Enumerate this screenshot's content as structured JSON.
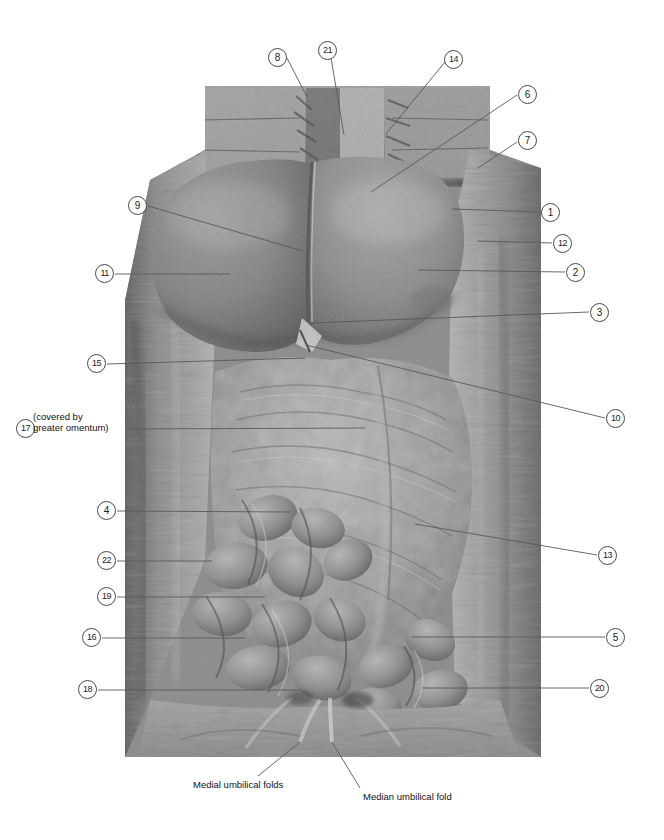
{
  "plate": {
    "title": "Abdominal cavity dissection — anterior view",
    "width": 664,
    "height": 840,
    "background": "#ffffff",
    "line_color": "#595959",
    "bubble_border": "#4a4a4a",
    "text_color": "#111111"
  },
  "photo": {
    "alt": "Grayscale cadaver dissection photograph of the opened anterior abdominal wall showing liver, greater omentum, small intestine and umbilical folds",
    "frame": {
      "left": 125,
      "top": 86,
      "right": 541,
      "bottom": 757
    }
  },
  "callouts": [
    {
      "id": "8",
      "label": "8",
      "side": "top",
      "bubble": {
        "x": 268,
        "y": 48
      },
      "leader": [
        [
          287,
          58
        ],
        [
          307,
          97
        ]
      ]
    },
    {
      "id": "21",
      "label": "21",
      "side": "top",
      "bubble": {
        "x": 318,
        "y": 41
      },
      "leader": [
        [
          330,
          52
        ],
        [
          344,
          135
        ]
      ]
    },
    {
      "id": "14",
      "label": "14",
      "side": "top",
      "bubble": {
        "x": 444,
        "y": 50
      },
      "leader": [
        [
          445,
          62
        ],
        [
          386,
          134
        ]
      ]
    },
    {
      "id": "6",
      "label": "6",
      "side": "right",
      "bubble": {
        "x": 518,
        "y": 85
      },
      "leader": [
        [
          517,
          95
        ],
        [
          371,
          192
        ]
      ]
    },
    {
      "id": "7",
      "label": "7",
      "side": "right",
      "bubble": {
        "x": 518,
        "y": 131
      },
      "leader": [
        [
          517,
          142
        ],
        [
          478,
          168
        ]
      ]
    },
    {
      "id": "1",
      "label": "1",
      "side": "right",
      "bubble": {
        "x": 541,
        "y": 203
      },
      "leader": [
        [
          540,
          212
        ],
        [
          452,
          209
        ]
      ]
    },
    {
      "id": "12",
      "label": "12",
      "side": "right",
      "bubble": {
        "x": 553,
        "y": 234
      },
      "leader": [
        [
          552,
          243
        ],
        [
          478,
          241
        ]
      ]
    },
    {
      "id": "2",
      "label": "2",
      "side": "right",
      "bubble": {
        "x": 566,
        "y": 263
      },
      "leader": [
        [
          565,
          272
        ],
        [
          418,
          270
        ]
      ]
    },
    {
      "id": "3",
      "label": "3",
      "side": "right",
      "bubble": {
        "x": 590,
        "y": 303
      },
      "leader": [
        [
          589,
          312
        ],
        [
          311,
          323
        ]
      ]
    },
    {
      "id": "10",
      "label": "10",
      "side": "right",
      "bubble": {
        "x": 606,
        "y": 409
      },
      "leader": [
        [
          605,
          418
        ],
        [
          306,
          345
        ]
      ]
    },
    {
      "id": "13",
      "label": "13",
      "side": "right",
      "bubble": {
        "x": 598,
        "y": 546
      },
      "leader": [
        [
          597,
          555
        ],
        [
          415,
          524
        ]
      ]
    },
    {
      "id": "5",
      "label": "5",
      "side": "right",
      "bubble": {
        "x": 606,
        "y": 628
      },
      "leader": [
        [
          605,
          637
        ],
        [
          412,
          637
        ]
      ]
    },
    {
      "id": "20",
      "label": "20",
      "side": "right",
      "bubble": {
        "x": 590,
        "y": 679
      },
      "leader": [
        [
          589,
          688
        ],
        [
          422,
          688
        ]
      ]
    },
    {
      "id": "9",
      "label": "9",
      "side": "left",
      "bubble": {
        "x": 128,
        "y": 196
      },
      "leader": [
        [
          148,
          206
        ],
        [
          303,
          251
        ]
      ]
    },
    {
      "id": "11",
      "label": "11",
      "side": "left",
      "bubble": {
        "x": 95,
        "y": 264
      },
      "leader": [
        [
          115,
          274
        ],
        [
          230,
          274
        ]
      ]
    },
    {
      "id": "15",
      "label": "15",
      "side": "left",
      "bubble": {
        "x": 87,
        "y": 354
      },
      "leader": [
        [
          107,
          364
        ],
        [
          305,
          358
        ]
      ]
    },
    {
      "id": "17",
      "label": "17",
      "side": "left",
      "bubble": {
        "x": 16,
        "y": 419
      },
      "leader": [
        [
          130,
          429
        ],
        [
          365,
          428
        ]
      ]
    },
    {
      "id": "4",
      "label": "4",
      "side": "left",
      "bubble": {
        "x": 97,
        "y": 501
      },
      "leader": [
        [
          117,
          511
        ],
        [
          290,
          512
        ]
      ]
    },
    {
      "id": "22",
      "label": "22",
      "side": "left",
      "bubble": {
        "x": 97,
        "y": 551
      },
      "leader": [
        [
          117,
          561
        ],
        [
          212,
          561
        ]
      ]
    },
    {
      "id": "19",
      "label": "19",
      "side": "left",
      "bubble": {
        "x": 97,
        "y": 587
      },
      "leader": [
        [
          117,
          597
        ],
        [
          265,
          597
        ]
      ]
    },
    {
      "id": "16",
      "label": "16",
      "side": "left",
      "bubble": {
        "x": 82,
        "y": 628
      },
      "leader": [
        [
          102,
          638
        ],
        [
          245,
          638
        ]
      ]
    },
    {
      "id": "18",
      "label": "18",
      "side": "left",
      "bubble": {
        "x": 78,
        "y": 680
      },
      "leader": [
        [
          98,
          690
        ],
        [
          300,
          690
        ]
      ]
    }
  ],
  "notes": {
    "note_17_line1": "(covered by",
    "note_17_line2": "greater omentum)"
  },
  "captions": {
    "medial": "Medial umbilical folds",
    "median": "Median umbilical fold",
    "medial_leader": [
      [
        258,
        776
      ],
      [
        300,
        742
      ]
    ],
    "median_leader": [
      [
        360,
        788
      ],
      [
        332,
        742
      ]
    ]
  }
}
